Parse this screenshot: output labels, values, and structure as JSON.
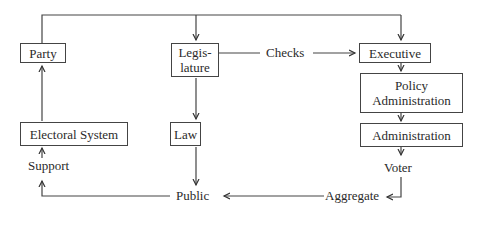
{
  "diagram": {
    "nodes": {
      "party": "Party",
      "legislature_line1": "Legis-",
      "legislature_line2": "lature",
      "executive": "Executive",
      "policy_admin_line1": "Policy",
      "policy_admin_line2": "Administration",
      "administration": "Administration",
      "electoral_system": "Electoral System",
      "law": "Law"
    },
    "labels": {
      "checks": "Checks",
      "support": "Support",
      "voter": "Voter",
      "public": "Public",
      "aggregate": "Aggregate"
    },
    "edges": [
      {
        "from": "top-line",
        "to": "Legislature"
      },
      {
        "from": "top-line",
        "to": "Executive"
      },
      {
        "from": "Party",
        "to": "top-line"
      },
      {
        "from": "Legislature",
        "to": "Executive",
        "label": "Checks"
      },
      {
        "from": "Executive",
        "to": "Policy Administration"
      },
      {
        "from": "Policy Administration",
        "to": "Administration"
      },
      {
        "from": "Administration",
        "to": "Voter"
      },
      {
        "from": "Voter",
        "to": "Aggregate"
      },
      {
        "from": "Aggregate",
        "to": "Public"
      },
      {
        "from": "Legislature",
        "to": "Law"
      },
      {
        "from": "Law",
        "to": "Public"
      },
      {
        "from": "Public",
        "to": "Support"
      },
      {
        "from": "Support",
        "to": "Electoral System"
      },
      {
        "from": "Electoral System",
        "to": "Party"
      }
    ]
  }
}
